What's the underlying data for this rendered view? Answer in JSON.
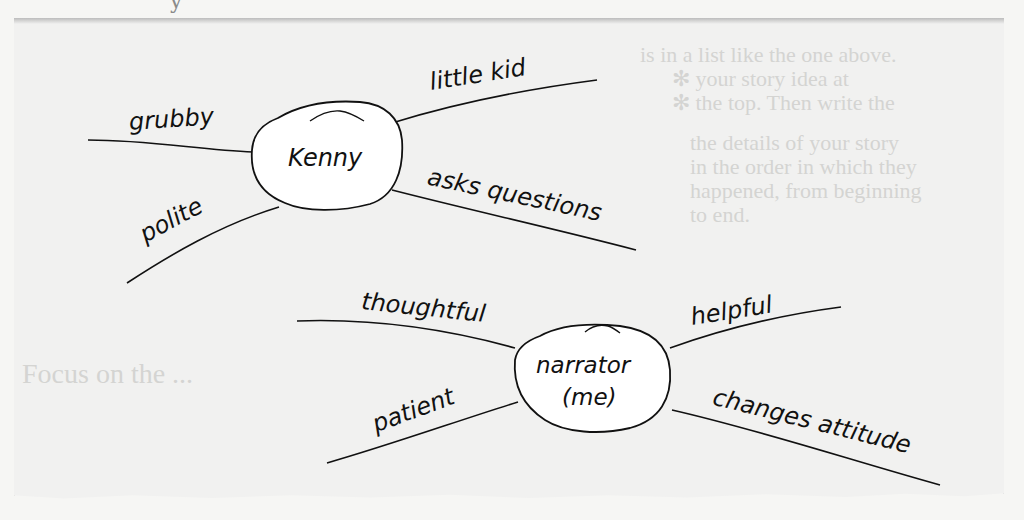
{
  "diagram": {
    "type": "character web / mind map",
    "colors": {
      "paper": "#f1f1f0",
      "node_fill": "#ffffff",
      "stroke": "#111111",
      "bleed_text": "#d4d4d2"
    },
    "nodes": [
      {
        "id": "kenny",
        "label": "Kenny",
        "traits": [
          {
            "label": "grubby",
            "position": "upper-left"
          },
          {
            "label": "little kid",
            "position": "upper-right"
          },
          {
            "label": "polite",
            "position": "lower-left"
          },
          {
            "label": "asks questions",
            "position": "lower-right"
          }
        ]
      },
      {
        "id": "narrator",
        "label_line1": "narrator",
        "label_line2": "(me)",
        "traits": [
          {
            "label": "thoughtful",
            "position": "upper-left"
          },
          {
            "label": "helpful",
            "position": "upper-right"
          },
          {
            "label": "patient",
            "position": "lower-left"
          },
          {
            "label": "changes attitude",
            "position": "lower-right"
          }
        ]
      }
    ]
  },
  "background_bleed_text": [
    "is in a list like the one above.",
    "✻ your story idea at",
    "✻ the top. Then write the",
    "the details of your story",
    "in the order in which they",
    "happened, from beginning",
    "to end.",
    "Focus on the ..."
  ]
}
